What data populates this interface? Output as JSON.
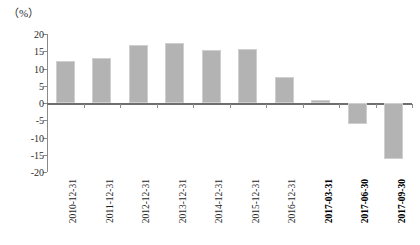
{
  "chart": {
    "unit_label": "（%）",
    "background": "#ffffff",
    "bar_color": "#b3b3b3",
    "axis_color": "#8a8a8a"
  },
  "chart_data": {
    "type": "bar",
    "title": "",
    "subtitle": "",
    "xlabel": "",
    "ylabel": "",
    "unit": "%",
    "grid": false,
    "legend": false,
    "ylim": [
      -20,
      20
    ],
    "yticks": [
      20,
      15,
      10,
      5,
      0,
      -5,
      -10,
      -15,
      -20
    ],
    "ytick_labels": [
      "20",
      "15",
      "10",
      "5",
      "0",
      "-5",
      "-10",
      "-15",
      "-20"
    ],
    "categories": [
      "2010-12-31",
      "2011-12-31",
      "2012-12-31",
      "2013-12-31",
      "2014-12-31",
      "2015-12-31",
      "2016-12-31",
      "2017-03-31",
      "2017-06-30",
      "2017-09-30"
    ],
    "category_emphasis": [
      false,
      false,
      false,
      false,
      false,
      false,
      false,
      true,
      true,
      true
    ],
    "values": [
      12.2,
      13.0,
      16.8,
      17.5,
      15.3,
      15.7,
      7.6,
      1.0,
      -6.2,
      -16.2
    ]
  }
}
